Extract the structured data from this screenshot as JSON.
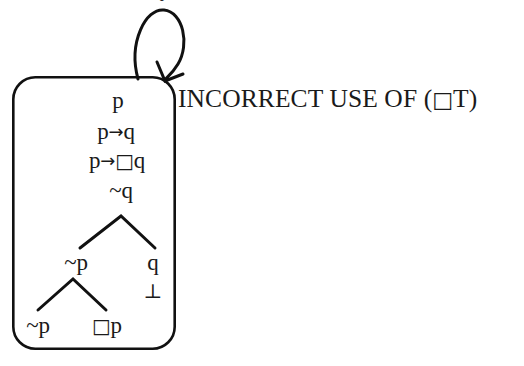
{
  "figure": {
    "kind": "modal-logic-tableau",
    "annotation": {
      "text": "INCORRECT USE OF (□T)",
      "x": 178,
      "y": 99
    },
    "world_box": {
      "name": "tableau-world-box",
      "x": 12,
      "y": 76,
      "width": 164,
      "height": 274,
      "corner_radius": 22,
      "stroke": "#111111",
      "stroke_width": 2.6,
      "fill": "#ffffff"
    },
    "self_loop": {
      "name": "reflexive-self-loop-arrow",
      "stroke": "#111111",
      "stroke_width": 3.0,
      "description": "loop rising from top edge of box and arrowing back down into it"
    },
    "nodes": [
      {
        "id": "n1",
        "text": "p",
        "x": 118,
        "y": 100,
        "kind": "formula"
      },
      {
        "id": "n2",
        "text": "p→q",
        "x": 116,
        "y": 131,
        "kind": "formula"
      },
      {
        "id": "n3",
        "text": "p→□q",
        "x": 117,
        "y": 160,
        "kind": "formula"
      },
      {
        "id": "n4",
        "text": "~q",
        "x": 121,
        "y": 190,
        "kind": "formula"
      },
      {
        "id": "n5",
        "text": "~p",
        "x": 76,
        "y": 262,
        "kind": "formula"
      },
      {
        "id": "n6",
        "text": "q",
        "x": 153,
        "y": 262,
        "kind": "formula"
      },
      {
        "id": "n7",
        "text": "⊥",
        "x": 153,
        "y": 291,
        "kind": "falsum"
      },
      {
        "id": "n8",
        "text": "~p",
        "x": 38,
        "y": 325,
        "kind": "formula"
      },
      {
        "id": "n9",
        "text": "□p",
        "x": 107,
        "y": 325,
        "kind": "formula"
      }
    ],
    "branches": [
      {
        "name": "branch-fork-upper",
        "apex_x": 121,
        "apex_y": 216,
        "left_x": 80,
        "right_x": 155,
        "foot_y": 248
      },
      {
        "name": "branch-fork-lower",
        "apex_x": 73,
        "apex_y": 279,
        "left_x": 38,
        "right_x": 106,
        "foot_y": 310
      }
    ],
    "top_clipped_fragment": "•",
    "colors": {
      "ink": "#1a1a1a",
      "stroke": "#111111",
      "background": "#ffffff"
    }
  }
}
